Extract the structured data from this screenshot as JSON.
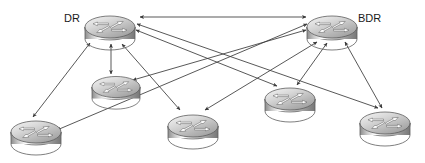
{
  "diagram": {
    "kind": "network-topology",
    "background_color": "#ffffff",
    "line_color": "#3a3a3a",
    "labels": {
      "dr": "DR",
      "bdr": "BDR"
    },
    "router_icon_name": "cisco-router-icon",
    "routers": [
      {
        "id": "dr",
        "label": "DR",
        "cx": 110,
        "cy": 28,
        "rx": 25,
        "ry": 11,
        "h": 13,
        "label_side": "left"
      },
      {
        "id": "bdr",
        "label": "BDR",
        "cx": 332,
        "cy": 28,
        "rx": 25,
        "ry": 11,
        "h": 13,
        "label_side": "right"
      },
      {
        "id": "r3",
        "label": "",
        "cx": 116,
        "cy": 88,
        "rx": 24,
        "ry": 10,
        "h": 12,
        "label_side": "none"
      },
      {
        "id": "r4",
        "label": "",
        "cx": 36,
        "cy": 133,
        "rx": 25,
        "ry": 10,
        "h": 12,
        "label_side": "none"
      },
      {
        "id": "r5",
        "label": "",
        "cx": 193,
        "cy": 127,
        "rx": 25,
        "ry": 10,
        "h": 12,
        "label_side": "none"
      },
      {
        "id": "r6",
        "label": "",
        "cx": 290,
        "cy": 100,
        "rx": 25,
        "ry": 10,
        "h": 12,
        "label_side": "none"
      },
      {
        "id": "r7",
        "label": "",
        "cx": 385,
        "cy": 124,
        "rx": 25,
        "ry": 10,
        "h": 12,
        "label_side": "none"
      }
    ],
    "links": [
      {
        "from": "dr",
        "to": "bdr",
        "x1": 140,
        "y1": 17,
        "x2": 306,
        "y2": 17,
        "arrows": "both",
        "name": "link-dr-bdr"
      },
      {
        "from": "dr",
        "to": "r3",
        "x1": 111,
        "y1": 44,
        "x2": 111,
        "y2": 74,
        "arrows": "both",
        "name": "link-dr-r3"
      },
      {
        "from": "dr",
        "to": "r4",
        "x1": 90,
        "y1": 43,
        "x2": 33,
        "y2": 117,
        "arrows": "both",
        "name": "link-dr-r4"
      },
      {
        "from": "dr",
        "to": "r5",
        "x1": 122,
        "y1": 44,
        "x2": 180,
        "y2": 110,
        "arrows": "both",
        "name": "link-dr-r5"
      },
      {
        "from": "dr",
        "to": "r6",
        "x1": 136,
        "y1": 30,
        "x2": 277,
        "y2": 86,
        "arrows": "both",
        "name": "link-dr-r6"
      },
      {
        "from": "dr",
        "to": "r7",
        "x1": 137,
        "y1": 24,
        "x2": 378,
        "y2": 108,
        "arrows": "both",
        "name": "link-dr-r7"
      },
      {
        "from": "bdr",
        "to": "r3",
        "x1": 306,
        "y1": 30,
        "x2": 133,
        "y2": 80,
        "arrows": "both",
        "name": "link-bdr-r3"
      },
      {
        "from": "bdr",
        "to": "r4",
        "x1": 307,
        "y1": 24,
        "x2": 57,
        "y2": 130,
        "arrows": "both",
        "name": "link-bdr-r4"
      },
      {
        "from": "bdr",
        "to": "r5",
        "x1": 317,
        "y1": 42,
        "x2": 205,
        "y2": 110,
        "arrows": "both",
        "name": "link-bdr-r5"
      },
      {
        "from": "bdr",
        "to": "r6",
        "x1": 327,
        "y1": 43,
        "x2": 297,
        "y2": 85,
        "arrows": "both",
        "name": "link-bdr-r6"
      },
      {
        "from": "bdr",
        "to": "r7",
        "x1": 345,
        "y1": 42,
        "x2": 382,
        "y2": 108,
        "arrows": "both",
        "name": "link-bdr-r7"
      }
    ]
  }
}
